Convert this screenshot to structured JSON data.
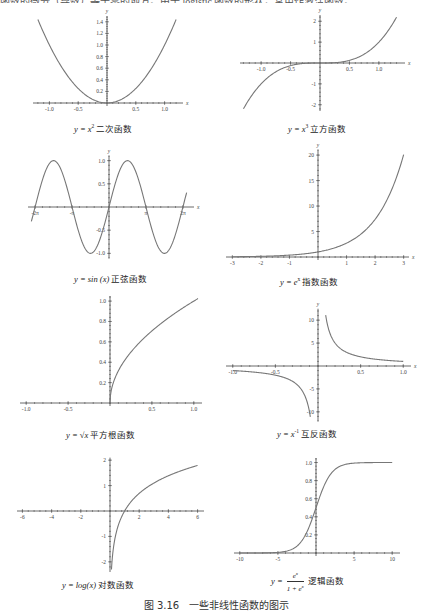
{
  "top_text": "函数的微分（导数）等于零的地方。由于 logistic 函数的形状，常用作激活函数。",
  "figure_caption": "图 3.16　一些非线性函数的图示",
  "chart_data": [
    {
      "type": "line",
      "id": "quadratic",
      "function": "x^2",
      "caption_prefix": "y = x",
      "caption_sup": "2",
      "caption_name": "二次函数",
      "xlabel": "x",
      "ylabel": "y",
      "xlim": [
        -1.25,
        1.25
      ],
      "ylim": [
        0,
        1.5
      ],
      "xticks": [
        -1.0,
        -0.5,
        0.5,
        1.0
      ],
      "xtick_labels": [
        "-1.0",
        "-0.5",
        "0.5",
        "1.0"
      ],
      "yticks": [
        0.2,
        0.4,
        0.6,
        0.8,
        1.0,
        1.2,
        1.4
      ],
      "ytick_labels": [
        "0.2",
        "0.4",
        "0.6",
        "0.8",
        "1.0",
        "1.2",
        "1.4"
      ],
      "x": [
        -1.2,
        -1.0,
        -0.8,
        -0.6,
        -0.4,
        -0.2,
        0,
        0.2,
        0.4,
        0.6,
        0.8,
        1.0,
        1.2
      ],
      "y": [
        1.44,
        1.0,
        0.64,
        0.36,
        0.16,
        0.04,
        0,
        0.04,
        0.16,
        0.36,
        0.64,
        1.0,
        1.44
      ]
    },
    {
      "type": "line",
      "id": "cubic",
      "function": "x^3",
      "caption_prefix": "y = x",
      "caption_sup": "3",
      "caption_name": "立方函数",
      "xlabel": "x",
      "ylabel": "y",
      "xlim": [
        -1.35,
        1.35
      ],
      "ylim": [
        -2.3,
        2.3
      ],
      "xticks": [
        -1.0,
        -0.5,
        0.5,
        1.0
      ],
      "xtick_labels": [
        "-1.0",
        "-0.5",
        "0.5",
        "1.0"
      ],
      "yticks": [
        -2,
        -1,
        1,
        2
      ],
      "ytick_labels": [
        "-2",
        "-1",
        "1",
        "2"
      ],
      "x": [
        -1.3,
        -1.0,
        -0.5,
        0,
        0.5,
        1.0,
        1.3
      ],
      "y": [
        -2.197,
        -1.0,
        -0.125,
        0,
        0.125,
        1.0,
        2.197
      ]
    },
    {
      "type": "line",
      "id": "sine",
      "function": "sin(x)",
      "caption_prefix": "y = sin (x)",
      "caption_sup": "",
      "caption_name": "正弦函数",
      "xlabel": "x",
      "ylabel": "y",
      "xlim": [
        -6.8,
        6.8
      ],
      "ylim": [
        -1.1,
        1.1
      ],
      "xticks": [
        -6.2832,
        -3.1416,
        3.1416,
        6.2832
      ],
      "xtick_labels": [
        "-2π",
        "-π",
        "π",
        "2π"
      ],
      "yticks": [
        -1.0,
        -0.5,
        0.5,
        1.0
      ],
      "ytick_labels": [
        "-1.0",
        "-0.5",
        "0.5",
        "1.0"
      ],
      "x": [
        -6.6,
        -4.712,
        -3.1416,
        -1.5708,
        0,
        1.5708,
        3.1416,
        4.712,
        6.6
      ],
      "y": [
        -0.311,
        1.0,
        0,
        -1.0,
        0,
        1.0,
        0,
        -1.0,
        0.311
      ]
    },
    {
      "type": "line",
      "id": "exponential",
      "function": "e^x",
      "caption_prefix": "y = e",
      "caption_sup": "x",
      "caption_name": "指数函数",
      "xlabel": "x",
      "ylabel": "y",
      "xlim": [
        -3.1,
        3.1
      ],
      "ylim": [
        0,
        21
      ],
      "xticks": [
        -3,
        -2,
        -1,
        1,
        2,
        3
      ],
      "xtick_labels": [
        "-3",
        "-2",
        "-1",
        "1",
        "2",
        "3"
      ],
      "yticks": [
        5,
        10,
        15,
        20
      ],
      "ytick_labels": [
        "5",
        "10",
        "15",
        "20"
      ],
      "x": [
        -3,
        -2,
        -1,
        0,
        1,
        2,
        3
      ],
      "y": [
        0.05,
        0.135,
        0.368,
        1.0,
        2.718,
        7.389,
        20.09
      ]
    },
    {
      "type": "line",
      "id": "sqrt",
      "function": "sqrt(x)",
      "caption_prefix": "y = √x",
      "caption_sup": "",
      "caption_name": "平方根函数",
      "xlabel": "",
      "ylabel": "",
      "xlim": [
        -1.05,
        1.05
      ],
      "ylim": [
        0,
        1.05
      ],
      "xticks": [
        -1.0,
        -0.5,
        0.5,
        1.0
      ],
      "xtick_labels": [
        "-1.0",
        "-0.5",
        "0.5",
        "1.0"
      ],
      "yticks": [
        0.2,
        0.4,
        0.6,
        0.8,
        1.0
      ],
      "ytick_labels": [
        "0.2",
        "0.4",
        "0.6",
        "0.8",
        "1.0"
      ],
      "x": [
        0.005,
        0.04,
        0.16,
        0.36,
        0.64,
        1.0,
        1.05
      ],
      "y": [
        0.071,
        0.2,
        0.4,
        0.6,
        0.8,
        1.0,
        1.025
      ]
    },
    {
      "type": "line",
      "id": "reciprocal",
      "function": "x^-1",
      "caption_prefix": "y = x",
      "caption_sup": "-1",
      "caption_name": "互反函数",
      "xlabel": "x",
      "ylabel": "y",
      "xlim": [
        -1.05,
        1.05
      ],
      "ylim": [
        -12,
        12.5
      ],
      "xticks": [
        -1.0,
        -0.5,
        0.5,
        1.0
      ],
      "xtick_labels": [
        "-1.0",
        "-0.5",
        "0.5",
        "1.0"
      ],
      "yticks": [
        -10,
        -5,
        5,
        10
      ],
      "ytick_labels": [
        "-10",
        "-5",
        "5",
        "10"
      ],
      "series": [
        {
          "name": "negative branch",
          "x": [
            -1.0,
            -0.5,
            -0.25,
            -0.1,
            -0.09
          ],
          "y": [
            -1.0,
            -2.0,
            -4.0,
            -10.0,
            -11.1
          ]
        },
        {
          "name": "positive branch",
          "x": [
            0.09,
            0.1,
            0.25,
            0.5,
            1.0
          ],
          "y": [
            11.1,
            10.0,
            4.0,
            2.0,
            1.0
          ]
        }
      ]
    },
    {
      "type": "line",
      "id": "logarithm",
      "function": "log(x)",
      "caption_prefix": "y = log(x)",
      "caption_sup": "",
      "caption_name": "对数函数",
      "xlabel": "",
      "ylabel": "",
      "xlim": [
        -6.2,
        6.2
      ],
      "ylim": [
        -2.4,
        2.1
      ],
      "xticks": [
        -6,
        -4,
        -2,
        2,
        4,
        6
      ],
      "xtick_labels": [
        "-6",
        "-4",
        "-2",
        "2",
        "4",
        "6"
      ],
      "yticks": [
        -2,
        -1,
        1,
        2
      ],
      "ytick_labels": [
        "-2",
        "-1",
        "1",
        "2"
      ],
      "x": [
        0.1,
        0.5,
        1,
        2,
        4,
        6
      ],
      "y": [
        -2.303,
        -0.693,
        0,
        0.693,
        1.386,
        1.792
      ]
    },
    {
      "type": "line",
      "id": "logistic",
      "function": "e^x/(1+e^x)",
      "caption_prefix": "y =",
      "caption_num": "e^x",
      "caption_den": "1 + e^x",
      "caption_name": "逻辑函数",
      "xlabel": "",
      "ylabel": "",
      "xlim": [
        -10.5,
        10.5
      ],
      "ylim": [
        0,
        1.05
      ],
      "xticks": [
        -10,
        -5,
        5,
        10
      ],
      "xtick_labels": [
        "-10",
        "-5",
        "5",
        "10"
      ],
      "yticks": [
        0.2,
        0.4,
        0.6,
        0.8,
        1.0
      ],
      "ytick_labels": [
        "0.2",
        "0.4",
        "0.6",
        "0.8",
        "1.0"
      ],
      "x": [
        -10,
        -5,
        -2,
        0,
        2,
        5,
        10
      ],
      "y": [
        5e-05,
        0.0067,
        0.119,
        0.5,
        0.881,
        0.9933,
        0.99995
      ]
    }
  ]
}
